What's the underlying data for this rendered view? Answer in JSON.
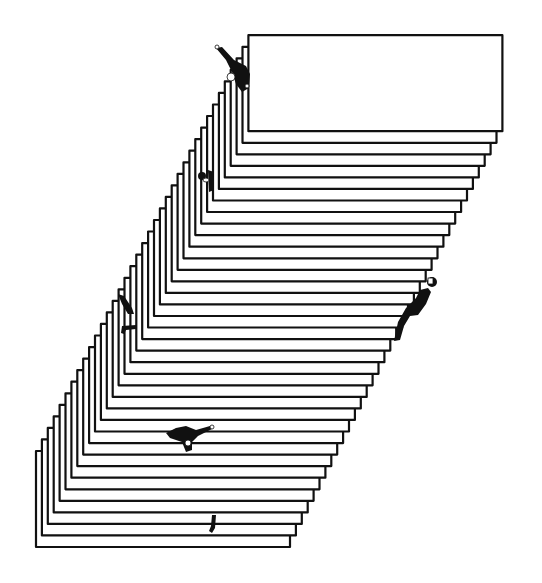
{
  "illustration": {
    "title": "",
    "description": "Stacked sheets forming a leaning staircase with climbing figures",
    "background": "#ffffff",
    "ink": "#111111",
    "stack": {
      "count": 37,
      "bottom_sheet": {
        "x": 36,
        "y": 451,
        "width": 254,
        "height": 96
      },
      "step_dx": 5.9,
      "step_dy": -11.55
    },
    "figures": [
      {
        "id": "figure-top-waving",
        "x": 232,
        "y": 62,
        "pose": "reaching"
      },
      {
        "id": "figure-upper-left",
        "x": 206,
        "y": 178,
        "pose": "peeking"
      },
      {
        "id": "figure-right-climbing",
        "x": 413,
        "y": 305,
        "pose": "climbing"
      },
      {
        "id": "figure-left-hanging",
        "x": 126,
        "y": 310,
        "pose": "hanging"
      },
      {
        "id": "figure-lower-lying",
        "x": 188,
        "y": 436,
        "pose": "lying"
      },
      {
        "id": "figure-bottom-legs",
        "x": 213,
        "y": 524,
        "pose": "legs"
      }
    ]
  }
}
